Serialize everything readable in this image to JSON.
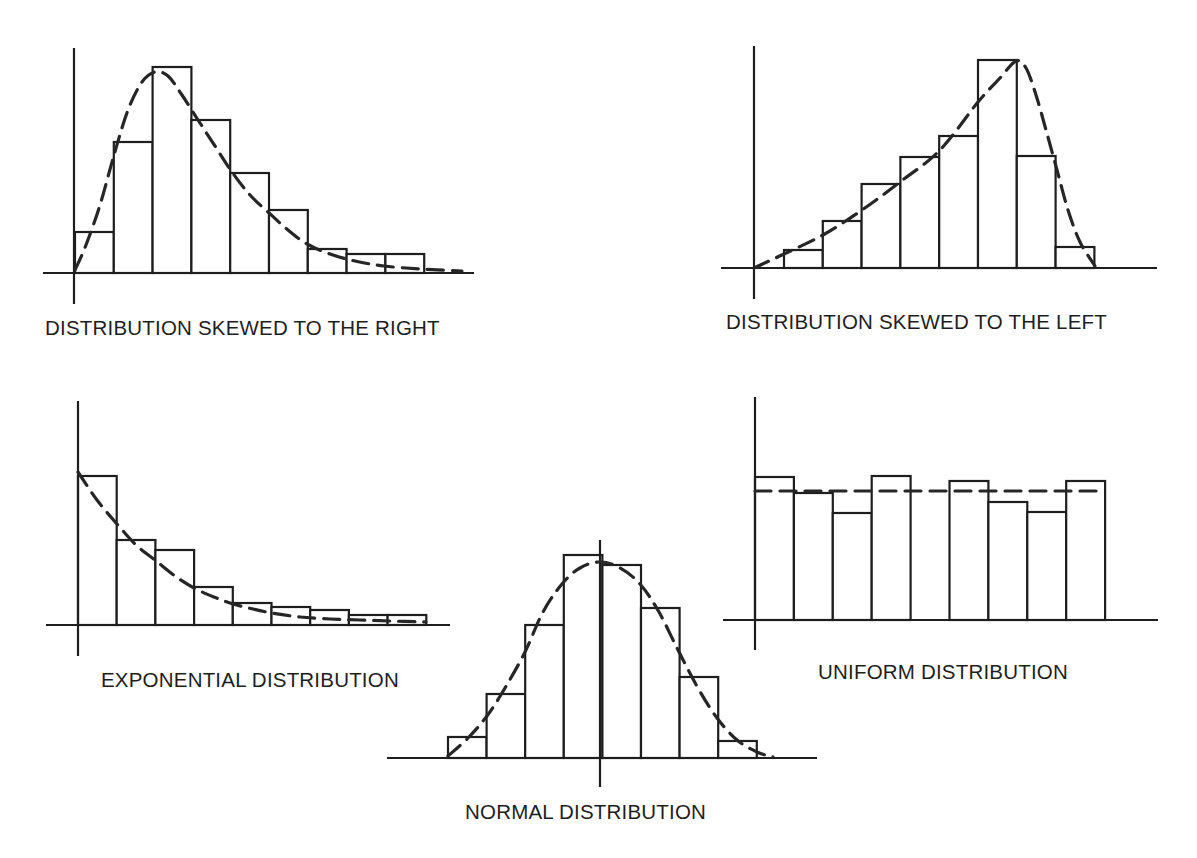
{
  "figure": {
    "background": "#ffffff",
    "ink_color": "#1e1e1e"
  },
  "chart_data": [
    {
      "type": "bar",
      "id": "skewed-right",
      "title": "DISTRIBUTION SKEWED TO THE RIGHT",
      "xlabel": "",
      "ylabel": "",
      "grid": false,
      "legend": null,
      "categories": [
        "1",
        "2",
        "3",
        "4",
        "5",
        "6",
        "7",
        "8",
        "9"
      ],
      "values": [
        41,
        131,
        206,
        153,
        100,
        63,
        24,
        19,
        19
      ],
      "overlay_curve": "right-skewed density (dashed)",
      "layout": {
        "y_axis": {
          "x": 74,
          "top": 48,
          "bottom": 304
        },
        "x_axis": {
          "y": 273,
          "left": 43,
          "right": 474
        },
        "bar_left": 75,
        "bar_width": 38.8,
        "curve": [
          [
            75,
            270
          ],
          [
            86,
            245
          ],
          [
            100,
            205
          ],
          [
            114,
            155
          ],
          [
            128,
            110
          ],
          [
            142,
            82
          ],
          [
            155,
            72
          ],
          [
            168,
            76
          ],
          [
            182,
            95
          ],
          [
            198,
            120
          ],
          [
            215,
            146
          ],
          [
            232,
            172
          ],
          [
            250,
            195
          ],
          [
            268,
            212
          ],
          [
            288,
            230
          ],
          [
            307,
            244
          ],
          [
            330,
            254
          ],
          [
            355,
            261
          ],
          [
            384,
            266
          ],
          [
            420,
            269
          ],
          [
            462,
            271
          ]
        ],
        "label": {
          "x": 45,
          "y": 318
        }
      }
    },
    {
      "type": "bar",
      "id": "skewed-left",
      "title": "DISTRIBUTION SKEWED TO THE LEFT",
      "xlabel": "",
      "ylabel": "",
      "grid": false,
      "legend": null,
      "categories": [
        "1",
        "2",
        "3",
        "4",
        "5",
        "6",
        "7",
        "8",
        "9"
      ],
      "values": [
        0,
        18,
        47,
        84,
        111,
        132,
        208,
        112,
        21
      ],
      "overlay_curve": "left-skewed density (dashed)",
      "layout": {
        "y_axis": {
          "x": 754,
          "top": 46,
          "bottom": 299
        },
        "x_axis": {
          "y": 268,
          "left": 721,
          "right": 1157
        },
        "bar_left": 745.2,
        "bar_width": 38.8,
        "curve": [
          [
            754,
            268
          ],
          [
            784,
            254
          ],
          [
            823,
            235
          ],
          [
            862,
            210
          ],
          [
            900,
            182
          ],
          [
            940,
            150
          ],
          [
            978,
            102
          ],
          [
            1000,
            78
          ],
          [
            1016,
            61
          ],
          [
            1026,
            68
          ],
          [
            1036,
            95
          ],
          [
            1046,
            130
          ],
          [
            1057,
            170
          ],
          [
            1068,
            210
          ],
          [
            1080,
            242
          ],
          [
            1095,
            266
          ]
        ],
        "label": {
          "x": 726,
          "y": 312
        }
      }
    },
    {
      "type": "bar",
      "id": "exponential",
      "title": "EXPONENTIAL DISTRIBUTION",
      "xlabel": "",
      "ylabel": "",
      "grid": false,
      "legend": null,
      "categories": [
        "1",
        "2",
        "3",
        "4",
        "5",
        "6",
        "7",
        "8",
        "9"
      ],
      "values": [
        149,
        85,
        75,
        38,
        22,
        18,
        15,
        10,
        10
      ],
      "overlay_curve": "exponential decay density (dashed)",
      "layout": {
        "y_axis": {
          "x": 78,
          "top": 401,
          "bottom": 656
        },
        "x_axis": {
          "y": 625,
          "left": 46,
          "right": 450
        },
        "bar_left": 78,
        "bar_width": 38.7,
        "curve": [
          [
            78,
            472
          ],
          [
            97,
            500
          ],
          [
            117,
            524
          ],
          [
            136,
            545
          ],
          [
            155,
            560
          ],
          [
            175,
            576
          ],
          [
            194,
            588
          ],
          [
            214,
            597
          ],
          [
            233,
            604
          ],
          [
            253,
            609
          ],
          [
            272,
            613
          ],
          [
            300,
            617
          ],
          [
            330,
            619
          ],
          [
            360,
            620
          ],
          [
            390,
            621
          ],
          [
            426,
            622
          ]
        ],
        "label": {
          "x": 101,
          "y": 670
        }
      }
    },
    {
      "type": "bar",
      "id": "normal",
      "title": "NORMAL DISTRIBUTION",
      "xlabel": "",
      "ylabel": "",
      "grid": false,
      "legend": null,
      "categories": [
        "1",
        "2",
        "3",
        "4",
        "5",
        "6",
        "7",
        "8"
      ],
      "values": [
        21,
        64,
        133,
        203,
        193,
        150,
        81,
        17
      ],
      "overlay_curve": "normal (bell) density (dashed)",
      "layout": {
        "y_axis": {
          "x": 600,
          "top": 540,
          "bottom": 787
        },
        "x_axis": {
          "y": 758,
          "left": 387,
          "right": 817
        },
        "bar_left": 448,
        "bar_width": 38.6,
        "curve": [
          [
            448,
            756
          ],
          [
            468,
            738
          ],
          [
            487,
            716
          ],
          [
            505,
            688
          ],
          [
            525,
            652
          ],
          [
            543,
            612
          ],
          [
            562,
            584
          ],
          [
            580,
            568
          ],
          [
            600,
            562
          ],
          [
            620,
            568
          ],
          [
            640,
            584
          ],
          [
            659,
            612
          ],
          [
            678,
            650
          ],
          [
            698,
            688
          ],
          [
            717,
            718
          ],
          [
            737,
            740
          ],
          [
            757,
            752
          ],
          [
            773,
            757
          ]
        ],
        "label": {
          "x": 465,
          "y": 802
        }
      }
    },
    {
      "type": "bar",
      "id": "uniform",
      "title": "UNIFORM DISTRIBUTION",
      "xlabel": "",
      "ylabel": "",
      "grid": false,
      "legend": null,
      "categories": [
        "1",
        "2",
        "3",
        "4",
        "5",
        "6",
        "7",
        "8",
        "9"
      ],
      "values": [
        143,
        127,
        107,
        144,
        0,
        139,
        118,
        108,
        139
      ],
      "overlay_curve": "uniform density at ~129 (dashed horizontal)",
      "layout": {
        "y_axis": {
          "x": 755,
          "top": 397,
          "bottom": 650
        },
        "x_axis": {
          "y": 620,
          "left": 723,
          "right": 1158
        },
        "bar_left": 755,
        "bar_width": 38.9,
        "curve": [
          [
            755,
            491
          ],
          [
            1105,
            491
          ]
        ],
        "label": {
          "x": 818,
          "y": 662
        }
      }
    }
  ]
}
